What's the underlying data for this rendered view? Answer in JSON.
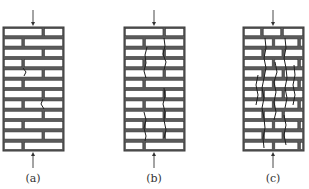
{
  "figure": {
    "courses": 12,
    "line_color": "#3a3a3a",
    "panels": [
      {
        "id": "a",
        "label": "(a)",
        "x": 3,
        "width": 61,
        "bricks_per_row": 2,
        "cracks": [
          [
            [
              23,
              68
            ],
            [
              26,
              72
            ],
            [
              24,
              76
            ]
          ],
          [
            [
              43,
              99
            ],
            [
              41,
              104
            ],
            [
              44,
              109
            ]
          ]
        ]
      },
      {
        "id": "b",
        "label": "(b)",
        "x": 124,
        "width": 61,
        "bricks_per_row": 2,
        "cracks": [
          [
            [
              164,
              38
            ],
            [
              165,
              46
            ],
            [
              163,
              54
            ],
            [
              166,
              62
            ],
            [
              164,
              70
            ]
          ],
          [
            [
              147,
              47
            ],
            [
              145,
              55
            ],
            [
              146,
              63
            ],
            [
              144,
              71
            ],
            [
              146,
              78
            ]
          ],
          [
            [
              164,
              88
            ],
            [
              165,
              96
            ],
            [
              163,
              104
            ],
            [
              165,
              112
            ],
            [
              164,
              120
            ],
            [
              166,
              130
            ],
            [
              164,
              138
            ]
          ],
          [
            [
              144,
              112
            ],
            [
              146,
              120
            ],
            [
              144,
              128
            ],
            [
              146,
              136
            ],
            [
              145,
              141
            ]
          ]
        ]
      },
      {
        "id": "c",
        "label": "(c)",
        "x": 243,
        "width": 61,
        "bricks_per_row": 3,
        "cracks": [
          [
            [
              265,
              38
            ],
            [
              266,
              48
            ],
            [
              264,
              58
            ],
            [
              266,
              68
            ],
            [
              264,
              78
            ],
            [
              262,
              88
            ],
            [
              264,
              98
            ],
            [
              262,
              108
            ],
            [
              264,
              118
            ],
            [
              265,
              128
            ],
            [
              263,
              138
            ],
            [
              264,
              148
            ]
          ],
          [
            [
              258,
              75
            ],
            [
              256,
              85
            ],
            [
              258,
              95
            ],
            [
              256,
              105
            ]
          ],
          [
            [
              275,
              62
            ],
            [
              277,
              72
            ],
            [
              274,
              82
            ],
            [
              276,
              92
            ],
            [
              274,
              102
            ],
            [
              276,
              112
            ],
            [
              274,
              120
            ]
          ],
          [
            [
              285,
              38
            ],
            [
              286,
              48
            ],
            [
              284,
              58
            ],
            [
              286,
              68
            ],
            [
              287,
              78
            ],
            [
              285,
              88
            ],
            [
              287,
              98
            ],
            [
              285,
              108
            ]
          ],
          [
            [
              294,
              65
            ],
            [
              295,
              75
            ],
            [
              293,
              85
            ],
            [
              295,
              95
            ],
            [
              293,
              105
            ]
          ],
          [
            [
              284,
              115
            ],
            [
              286,
              125
            ],
            [
              284,
              135
            ],
            [
              286,
              145
            ]
          ]
        ]
      }
    ],
    "load_arrow": {
      "top_y1": 10,
      "top_y2": 26,
      "bottom_y1": 168,
      "bottom_y2": 152
    }
  }
}
